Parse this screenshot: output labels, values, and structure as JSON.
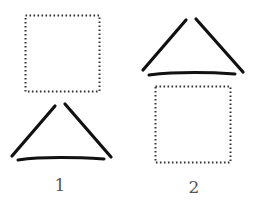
{
  "figures": [
    {
      "label": "1",
      "square": {
        "x": 25,
        "y": 15,
        "w": 74,
        "h": 76,
        "style": "dotted"
      },
      "triangle": {
        "left_stroke": [
          [
            12,
            156
          ],
          [
            56,
            105
          ]
        ],
        "right_stroke": [
          [
            65,
            104
          ],
          [
            111,
            157
          ]
        ],
        "base_stroke": [
          [
            18,
            160
          ],
          [
            104,
            159
          ]
        ]
      }
    },
    {
      "label": "2",
      "square": {
        "x": 155,
        "y": 86,
        "w": 75,
        "h": 76,
        "style": "dotted"
      },
      "triangle": {
        "left_stroke": [
          [
            143,
            70
          ],
          [
            186,
            19
          ]
        ],
        "right_stroke": [
          [
            196,
            19
          ],
          [
            242,
            72
          ]
        ],
        "base_stroke": [
          [
            149,
            75
          ],
          [
            235,
            73
          ]
        ]
      }
    }
  ],
  "colors": {
    "stroke": "#111111",
    "dots": "#333333",
    "label": "#555555"
  }
}
